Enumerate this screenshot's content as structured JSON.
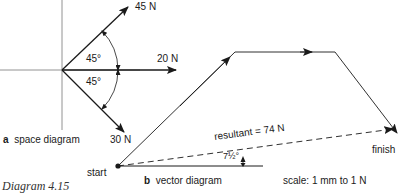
{
  "space_diagram": {
    "label_letter": "a",
    "label_text": "space diagram",
    "forces": [
      {
        "name": "45 N",
        "angle_deg": 45
      },
      {
        "name": "20 N",
        "angle_deg": 0
      },
      {
        "name": "30 N",
        "angle_deg": -45
      }
    ],
    "angle_upper": "45°",
    "angle_lower": "45°"
  },
  "vector_diagram": {
    "label_letter": "b",
    "label_text": "vector diagram",
    "start_label": "start",
    "finish_label": "finish",
    "resultant_label": "resultant = 74 N",
    "resultant_angle": "7½°",
    "scale_label": "scale: 1 mm to 1 N"
  },
  "caption": "Diagram 4.15",
  "colors": {
    "ink": "#1a1a1a",
    "background": "#ffffff"
  }
}
